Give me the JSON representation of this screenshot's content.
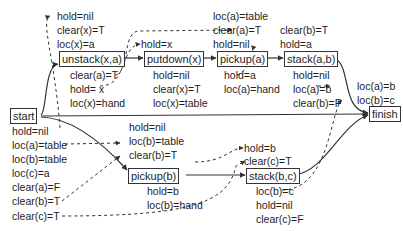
{
  "nodes": {
    "start": "start",
    "unstack": "unstack(x,a)",
    "putdown": "putdown(x)",
    "pickup_a": "pickup(a)",
    "stack_ab": "stack(a,b)",
    "finish": "finish",
    "pickup_b": "pickup(b)",
    "stack_bc": "stack(b,c)"
  },
  "preconditions": {
    "unstack": [
      "hold=nil",
      "clear(x)=T",
      "loc(x)=a"
    ],
    "putdown": [
      "hold=x"
    ],
    "pickup_a": [
      "loc(a)=table",
      "clear(a)=T",
      "hold=nil"
    ],
    "stack_ab": [
      "clear(b)=T",
      "hold=a"
    ],
    "finish": [
      "loc(a)=b",
      "loc(b)=c"
    ],
    "pickup_b": [
      "hold=nil",
      "loc(b)=table",
      "clear(b)=T"
    ],
    "stack_bc": [
      "hold=b",
      "clear(c)=T"
    ]
  },
  "effects": {
    "start": [
      "hold=nil",
      "loc(a)=table",
      "loc(b)=table",
      "loc(c)=a",
      "clear(a)=F",
      "clear(b)=T",
      "clear(c)=T"
    ],
    "unstack": [
      "clear(a)=T",
      "hold= x",
      "loc(x)=hand"
    ],
    "putdown": [
      "hold=nil",
      "clear(x)=T",
      "loc(x)=table"
    ],
    "pickup_a": [
      "hold=a",
      "loc(a)=hand"
    ],
    "stack_ab": [
      "hold=nil",
      "loc(a)=b",
      "clear(b)=F"
    ],
    "pickup_b": [
      "hold=b",
      "loc(b)=hand"
    ],
    "stack_bc": [
      "loc(b)=c",
      "hold=nil",
      "clear(c)=F"
    ]
  },
  "colors": {
    "line": "#333333",
    "text": "#1e1e1e",
    "background": "#ffffff"
  }
}
